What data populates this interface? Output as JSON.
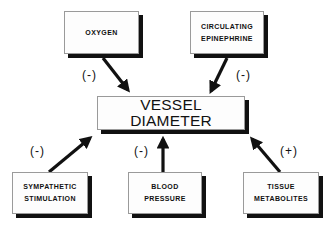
{
  "diagram": {
    "center": {
      "label": "VESSEL DIAMETER"
    },
    "inputs": [
      {
        "id": "oxygen",
        "lines": [
          "OXYGEN"
        ],
        "effect": "(-)"
      },
      {
        "id": "circulating-epinephrine",
        "lines": [
          "CIRCULATING",
          "EPINEPHRINE"
        ],
        "effect": "(-)"
      },
      {
        "id": "sympathetic-stimulation",
        "lines": [
          "SYMPATHETIC",
          "STIMULATION"
        ],
        "effect": "(-)"
      },
      {
        "id": "blood-pressure",
        "lines": [
          "BLOOD",
          "PRESSURE"
        ],
        "effect": "(-)"
      },
      {
        "id": "tissue-metabolites",
        "lines": [
          "TISSUE",
          "METABOLITES"
        ],
        "effect": "(+)"
      }
    ],
    "colors": {
      "stroke": "#111111",
      "box_fill": "#fdfdfd",
      "box_border": "#9a9a9a"
    }
  }
}
